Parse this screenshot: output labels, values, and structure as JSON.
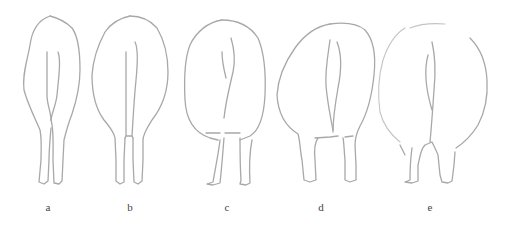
{
  "figure": {
    "panels": [
      {
        "id": "a",
        "label": "a",
        "description": "rear view outline, narrow body with legs close together"
      },
      {
        "id": "b",
        "label": "b",
        "description": "rear view outline, oval body with straight parallel legs"
      },
      {
        "id": "c",
        "label": "c",
        "description": "rear view outline, broad oval body with wide-set legs"
      },
      {
        "id": "d",
        "label": "d",
        "description": "rear view outline, broad body with slightly splayed legs"
      },
      {
        "id": "e",
        "label": "e",
        "description": "rear view outline, very wide round body with splayed legs"
      }
    ],
    "colors": {
      "stroke": "#a8a8a8",
      "label": "#444444",
      "background": "#ffffff"
    }
  }
}
